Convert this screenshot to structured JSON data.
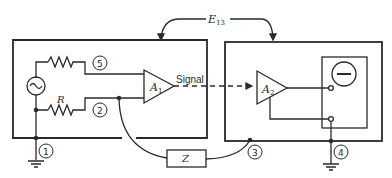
{
  "diagram": {
    "voltage_label": "E",
    "voltage_subscript": "13",
    "amplifier_1": {
      "label": "A",
      "subscript": "1"
    },
    "amplifier_2": {
      "label": "A",
      "subscript": "2"
    },
    "signal_label": "Signal",
    "resistor_label": "R",
    "impedance_label": "Z",
    "nodes": [
      "1",
      "2",
      "3",
      "4",
      "5"
    ],
    "source_symbol": "~",
    "colors": {
      "stroke": "#2a2a2a",
      "background": "#ffffff"
    }
  }
}
